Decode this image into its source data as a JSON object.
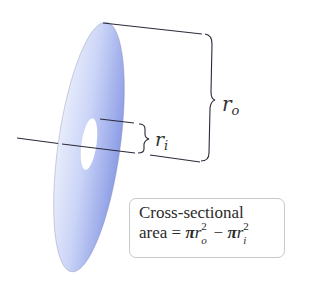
{
  "diagram": {
    "labels": {
      "outer_radius": "r",
      "outer_radius_sub": "o",
      "inner_radius": "r",
      "inner_radius_sub": "i"
    },
    "caption": {
      "line1": "Cross-sectional",
      "line2_prefix": "area = ",
      "pi": "π",
      "r": "r",
      "sup": "2",
      "sub_outer": "o",
      "minus": " − ",
      "sub_inner": "i"
    },
    "colors": {
      "disk_light": "#dfe6fb",
      "disk_dark": "#8f9fe8",
      "lines": "#2a2a3a",
      "box_border": "#c9c9c9"
    }
  }
}
